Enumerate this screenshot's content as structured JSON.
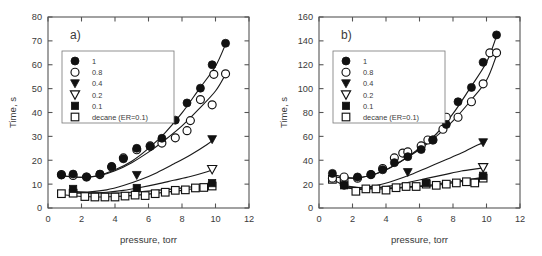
{
  "figure": {
    "background": "#ffffff",
    "marker_color": "#111111",
    "axis_color": "#555555"
  },
  "chart_data": [
    {
      "type": "scatter",
      "panel": "a)",
      "title": "",
      "xlabel": "pressure, torr",
      "ylabel": "Time, s",
      "xlim": [
        0,
        12
      ],
      "ylim": [
        0,
        80
      ],
      "xticks": [
        0,
        2,
        4,
        6,
        8,
        10,
        12
      ],
      "yticks": [
        0,
        10,
        20,
        30,
        40,
        50,
        60,
        70,
        80
      ],
      "grid": false,
      "legend_position": "upper left",
      "series": [
        {
          "name": "1",
          "marker": "filled-circle",
          "points": [
            [
              0.8,
              13.8
            ],
            [
              1.5,
              14.2
            ],
            [
              2.3,
              13.0
            ],
            [
              3.1,
              14.2
            ],
            [
              3.8,
              17.4
            ],
            [
              4.5,
              20.6
            ],
            [
              5.3,
              25.0
            ],
            [
              6.1,
              25.8
            ],
            [
              6.8,
              29.2
            ],
            [
              7.6,
              36.8
            ],
            [
              8.3,
              44.0
            ],
            [
              9.1,
              50.2
            ],
            [
              9.8,
              60.0
            ],
            [
              10.6,
              69.0
            ]
          ],
          "fit": [
            [
              0.7,
              13.6
            ],
            [
              2.0,
              12.8
            ],
            [
              3.0,
              13.6
            ],
            [
              4.0,
              16.0
            ],
            [
              5.0,
              19.6
            ],
            [
              6.0,
              25.0
            ],
            [
              7.0,
              31.6
            ],
            [
              8.0,
              39.8
            ],
            [
              9.0,
              49.6
            ],
            [
              10.0,
              59.4
            ],
            [
              10.6,
              68.6
            ]
          ]
        },
        {
          "name": "0.8",
          "marker": "open-circle",
          "points": [
            [
              0.8,
              14.0
            ],
            [
              1.5,
              13.6
            ],
            [
              2.3,
              13.0
            ],
            [
              3.1,
              14.0
            ],
            [
              3.8,
              17.2
            ],
            [
              4.5,
              21.0
            ],
            [
              5.3,
              24.4
            ],
            [
              6.1,
              26.0
            ],
            [
              6.8,
              27.2
            ],
            [
              7.6,
              29.4
            ],
            [
              8.3,
              32.4
            ],
            [
              8.5,
              36.6
            ],
            [
              9.1,
              45.4
            ],
            [
              9.8,
              43.2
            ],
            [
              9.9,
              56.0
            ],
            [
              10.6,
              56.2
            ]
          ],
          "fit": [
            [
              0.7,
              13.6
            ],
            [
              2.0,
              12.8
            ],
            [
              3.0,
              13.4
            ],
            [
              4.0,
              15.6
            ],
            [
              5.0,
              19.0
            ],
            [
              6.0,
              23.4
            ],
            [
              7.0,
              28.6
            ],
            [
              8.0,
              34.4
            ],
            [
              9.0,
              41.4
            ],
            [
              10.0,
              49.0
            ],
            [
              10.6,
              56.0
            ]
          ]
        },
        {
          "name": "0.4",
          "marker": "filled-triangle-down",
          "points": [
            [
              5.3,
              13.8
            ],
            [
              9.8,
              28.8
            ]
          ],
          "fit": [
            [
              1.4,
              6.6
            ],
            [
              2.5,
              6.8
            ],
            [
              3.5,
              7.6
            ],
            [
              4.5,
              9.4
            ],
            [
              5.5,
              11.8
            ],
            [
              6.5,
              14.8
            ],
            [
              7.5,
              18.4
            ],
            [
              8.5,
              22.2
            ],
            [
              9.5,
              26.6
            ],
            [
              9.9,
              28.8
            ]
          ]
        },
        {
          "name": "0.2",
          "marker": "open-triangle-down",
          "points": [
            [
              9.8,
              16.2
            ]
          ],
          "fit": [
            [
              1.4,
              6.2
            ],
            [
              2.5,
              6.2
            ],
            [
              3.5,
              6.6
            ],
            [
              4.5,
              7.4
            ],
            [
              5.5,
              8.6
            ],
            [
              6.5,
              10.0
            ],
            [
              7.5,
              11.6
            ],
            [
              8.5,
              13.2
            ],
            [
              9.5,
              15.2
            ],
            [
              9.9,
              16.2
            ]
          ]
        },
        {
          "name": "0.1",
          "marker": "filled-square",
          "points": [
            [
              1.5,
              8.0
            ],
            [
              5.3,
              8.4
            ],
            [
              9.8,
              10.4
            ]
          ],
          "fit": [
            [
              1.4,
              7.0
            ],
            [
              2.5,
              6.4
            ],
            [
              3.5,
              6.2
            ],
            [
              4.5,
              6.4
            ],
            [
              5.5,
              6.8
            ],
            [
              6.5,
              7.4
            ],
            [
              7.5,
              8.0
            ],
            [
              8.5,
              8.8
            ],
            [
              9.5,
              9.6
            ],
            [
              9.9,
              10.0
            ]
          ]
        },
        {
          "name": "decane (ER=0.1)",
          "marker": "open-square",
          "points": [
            [
              0.8,
              6.0
            ],
            [
              1.5,
              6.2
            ],
            [
              2.2,
              4.8
            ],
            [
              2.8,
              4.6
            ],
            [
              3.4,
              4.6
            ],
            [
              4.0,
              4.6
            ],
            [
              4.6,
              5.0
            ],
            [
              5.2,
              5.4
            ],
            [
              5.8,
              5.2
            ],
            [
              6.4,
              6.0
            ],
            [
              7.0,
              6.6
            ],
            [
              7.6,
              7.4
            ],
            [
              8.2,
              7.6
            ],
            [
              8.8,
              8.4
            ],
            [
              9.3,
              8.6
            ],
            [
              9.8,
              9.2
            ]
          ],
          "fit": [
            [
              0.8,
              5.6
            ],
            [
              2.0,
              4.8
            ],
            [
              3.0,
              4.6
            ],
            [
              4.0,
              4.8
            ],
            [
              5.0,
              5.2
            ],
            [
              6.0,
              5.8
            ],
            [
              7.0,
              6.6
            ],
            [
              8.0,
              7.4
            ],
            [
              9.0,
              8.4
            ],
            [
              9.8,
              9.2
            ]
          ]
        }
      ]
    },
    {
      "type": "scatter",
      "panel": "b)",
      "title": "",
      "xlabel": "pressure, torr",
      "ylabel": "Time, s",
      "xlim": [
        0,
        12
      ],
      "ylim": [
        0,
        160
      ],
      "xticks": [
        0,
        2,
        4,
        6,
        8,
        10,
        12
      ],
      "yticks": [
        0,
        20,
        40,
        60,
        80,
        100,
        120,
        140,
        160
      ],
      "grid": false,
      "legend_position": "upper left",
      "series": [
        {
          "name": "1",
          "marker": "filled-circle",
          "points": [
            [
              0.8,
              29.0
            ],
            [
              1.5,
              19.0
            ],
            [
              2.3,
              26.0
            ],
            [
              3.1,
              28.0
            ],
            [
              3.8,
              32.0
            ],
            [
              4.5,
              38.0
            ],
            [
              5.3,
              43.0
            ],
            [
              6.1,
              49.0
            ],
            [
              6.8,
              57.0
            ],
            [
              7.6,
              70.0
            ],
            [
              8.3,
              89.0
            ],
            [
              9.1,
              101.0
            ],
            [
              9.8,
              122.0
            ],
            [
              10.6,
              145.0
            ]
          ],
          "fit": [
            [
              0.8,
              28.0
            ],
            [
              2.0,
              25.0
            ],
            [
              3.0,
              27.0
            ],
            [
              4.0,
              32.0
            ],
            [
              5.0,
              40.0
            ],
            [
              6.0,
              50.0
            ],
            [
              7.0,
              62.0
            ],
            [
              8.0,
              79.0
            ],
            [
              9.0,
              100.0
            ],
            [
              10.0,
              122.0
            ],
            [
              10.6,
              144.0
            ]
          ]
        },
        {
          "name": "0.8",
          "marker": "open-circle",
          "points": [
            [
              0.8,
              25.0
            ],
            [
              1.5,
              26.0
            ],
            [
              2.3,
              25.0
            ],
            [
              3.1,
              28.0
            ],
            [
              3.8,
              33.0
            ],
            [
              4.5,
              42.0
            ],
            [
              5.0,
              46.0
            ],
            [
              5.3,
              47.0
            ],
            [
              6.1,
              52.0
            ],
            [
              6.5,
              57.0
            ],
            [
              6.8,
              57.0
            ],
            [
              7.4,
              66.0
            ],
            [
              7.6,
              76.0
            ],
            [
              8.3,
              76.0
            ],
            [
              9.1,
              89.0
            ],
            [
              9.8,
              104.0
            ],
            [
              10.2,
              130.0
            ],
            [
              10.6,
              130.0
            ]
          ],
          "fit": [
            [
              0.8,
              26.0
            ],
            [
              2.0,
              25.0
            ],
            [
              3.0,
              27.0
            ],
            [
              4.0,
              32.0
            ],
            [
              5.0,
              40.0
            ],
            [
              6.0,
              49.0
            ],
            [
              7.0,
              60.0
            ],
            [
              8.0,
              73.0
            ],
            [
              9.0,
              89.0
            ],
            [
              10.0,
              107.0
            ],
            [
              10.6,
              128.0
            ]
          ]
        },
        {
          "name": "0.4",
          "marker": "filled-triangle-down",
          "points": [
            [
              5.3,
              30.0
            ],
            [
              9.8,
              55.0
            ]
          ],
          "fit": [
            [
              1.4,
              17.0
            ],
            [
              2.5,
              17.0
            ],
            [
              3.5,
              19.0
            ],
            [
              4.5,
              23.0
            ],
            [
              5.5,
              28.0
            ],
            [
              6.5,
              34.0
            ],
            [
              7.5,
              40.0
            ],
            [
              8.5,
              46.0
            ],
            [
              9.5,
              53.0
            ],
            [
              9.9,
              55.0
            ]
          ]
        },
        {
          "name": "0.2",
          "marker": "open-triangle-down",
          "points": [
            [
              9.8,
              34.0
            ]
          ],
          "fit": [
            [
              1.4,
              17.0
            ],
            [
              2.5,
              16.0
            ],
            [
              3.5,
              17.0
            ],
            [
              4.5,
              19.0
            ],
            [
              5.5,
              22.0
            ],
            [
              6.5,
              25.0
            ],
            [
              7.5,
              28.0
            ],
            [
              8.5,
              31.0
            ],
            [
              9.5,
              33.0
            ],
            [
              9.9,
              34.0
            ]
          ]
        },
        {
          "name": "0.1",
          "marker": "filled-square",
          "points": [
            [
              1.5,
              19.0
            ],
            [
              6.4,
              21.0
            ],
            [
              9.8,
              27.0
            ]
          ],
          "fit": [
            [
              1.4,
              19.0
            ],
            [
              2.5,
              17.0
            ],
            [
              3.5,
              17.0
            ],
            [
              4.5,
              17.0
            ],
            [
              5.5,
              18.0
            ],
            [
              6.5,
              19.0
            ],
            [
              7.5,
              21.0
            ],
            [
              8.5,
              23.0
            ],
            [
              9.5,
              25.0
            ],
            [
              9.9,
              26.0
            ]
          ]
        },
        {
          "name": "decane (ER=0.1)",
          "marker": "open-square",
          "points": [
            [
              0.8,
              24.0
            ],
            [
              1.5,
              23.0
            ],
            [
              2.2,
              14.0
            ],
            [
              2.8,
              16.0
            ],
            [
              3.4,
              16.0
            ],
            [
              4.0,
              15.0
            ],
            [
              4.6,
              17.0
            ],
            [
              5.2,
              18.0
            ],
            [
              5.8,
              18.0
            ],
            [
              6.4,
              20.0
            ],
            [
              7.0,
              19.0
            ],
            [
              7.6,
              20.0
            ],
            [
              8.2,
              21.0
            ],
            [
              8.8,
              22.0
            ],
            [
              9.3,
              21.0
            ],
            [
              9.8,
              25.0
            ]
          ],
          "fit": [
            [
              0.8,
              24.0
            ],
            [
              2.0,
              16.0
            ],
            [
              3.0,
              16.0
            ],
            [
              4.0,
              16.0
            ],
            [
              5.0,
              17.0
            ],
            [
              6.0,
              18.0
            ],
            [
              7.0,
              19.0
            ],
            [
              8.0,
              21.0
            ],
            [
              9.0,
              23.0
            ],
            [
              9.8,
              25.0
            ]
          ]
        }
      ]
    }
  ]
}
